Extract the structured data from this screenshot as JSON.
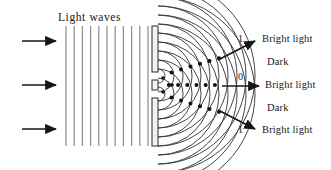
{
  "figure": {
    "title": "Light waves",
    "kind": "double-slit-interference-diagram",
    "background_color": "#ffffff",
    "ink_color": "#17171a",
    "wave_color": "#3a3a40",
    "plane_wave_color": "#8d8d96"
  },
  "incoming": {
    "arrow_count": 3,
    "arrows": [
      {
        "name": "incoming-arrow-top",
        "y": 41
      },
      {
        "name": "incoming-arrow-middle",
        "y": 85
      },
      {
        "name": "incoming-arrow-bottom",
        "y": 129
      }
    ]
  },
  "plane_waves": {
    "label": "Light waves",
    "line_count": 12,
    "x_start": 66,
    "x_spacing": 8.2,
    "y_top": 26,
    "y_bottom": 146
  },
  "barrier": {
    "name": "double-slit-barrier",
    "x": 152,
    "width": 6,
    "segments": [
      {
        "name": "barrier-segment-top",
        "y_top": 26,
        "y_bottom": 72
      },
      {
        "name": "barrier-segment-middle",
        "y_top": 80,
        "y_bottom": 90
      },
      {
        "name": "barrier-segment-bottom",
        "y_top": 98,
        "y_bottom": 146
      }
    ],
    "slits": [
      {
        "name": "slit-upper",
        "y": 76
      },
      {
        "name": "slit-lower",
        "y": 94
      }
    ]
  },
  "circular_waves": {
    "source_x": 158,
    "sources_y": [
      76,
      94
    ],
    "arc_count_per_source": 11,
    "arc_spacing": 9.0,
    "first_radius": 7.0
  },
  "fringe_labels": [
    {
      "order": "1",
      "text": "Bright light",
      "type": "bright",
      "x": 268,
      "y": 40,
      "order_x": 241,
      "order_y": 40
    },
    {
      "order": "",
      "text": "Dark",
      "type": "dark",
      "x": 268,
      "y": 63,
      "order_x": null,
      "order_y": null
    },
    {
      "order": "0",
      "text": "Bright light",
      "type": "bright",
      "x": 268,
      "y": 86,
      "order_x": 241,
      "order_y": 78
    },
    {
      "order": "",
      "text": "Dark",
      "type": "dark",
      "x": 268,
      "y": 109,
      "order_x": null,
      "order_y": null
    },
    {
      "order": "1",
      "text": "Bright light",
      "type": "bright",
      "x": 268,
      "y": 131,
      "order_x": 241,
      "order_y": 131
    }
  ],
  "output_arrows": [
    {
      "name": "output-arrow-upper-bright",
      "x1": 218,
      "y1": 60,
      "x2": 258,
      "y2": 40
    },
    {
      "name": "output-arrow-central-bright",
      "x1": 222,
      "y1": 86,
      "x2": 262,
      "y2": 86
    },
    {
      "name": "output-arrow-lower-bright",
      "x1": 218,
      "y1": 110,
      "x2": 258,
      "y2": 130
    }
  ]
}
